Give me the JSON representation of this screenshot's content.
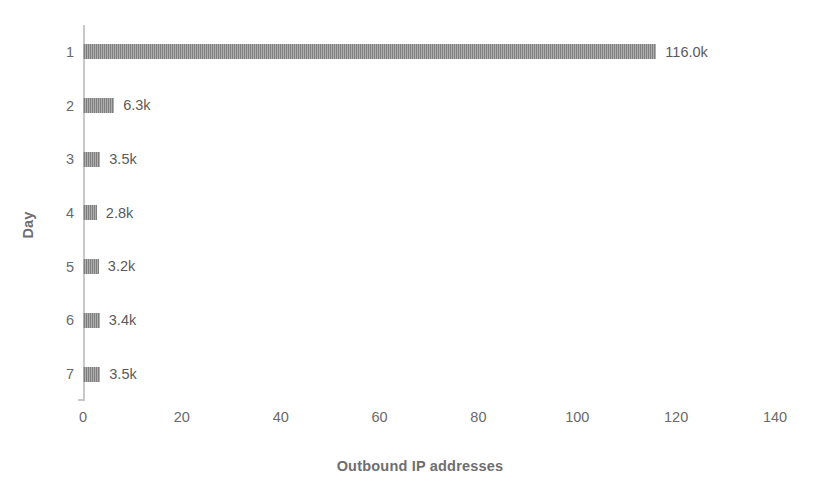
{
  "chart_data": {
    "type": "bar",
    "orientation": "horizontal",
    "title": "",
    "xlabel": "Outbound IP addresses",
    "ylabel": "Day",
    "categories": [
      "1",
      "2",
      "3",
      "4",
      "5",
      "6",
      "7"
    ],
    "values": [
      116.0,
      6.3,
      3.5,
      2.8,
      3.2,
      3.4,
      3.5
    ],
    "data_labels": [
      "116.0k",
      "6.3k",
      "3.5k",
      "2.8k",
      "3.2k",
      "3.4k",
      "3.5k"
    ],
    "units": "thousands",
    "xlim": [
      0,
      140
    ],
    "xticks": [
      0,
      20,
      40,
      60,
      80,
      100,
      120,
      140
    ],
    "xtick_labels": [
      "0",
      "20",
      "40",
      "60",
      "80",
      "100",
      "120",
      "140"
    ],
    "grid": false,
    "legend": null,
    "series": [
      {
        "name": "Outbound IP addresses",
        "values": [
          116.0,
          6.3,
          3.5,
          2.8,
          3.2,
          3.4,
          3.5
        ]
      }
    ],
    "colors": {
      "bar": "#8d8d8d",
      "axis": "#c8c8c8",
      "tick_text": "#6a6a6a",
      "axis_title_text": "#6e6e6e",
      "data_label_text": "#5a5a5a",
      "background": "#ffffff"
    }
  }
}
